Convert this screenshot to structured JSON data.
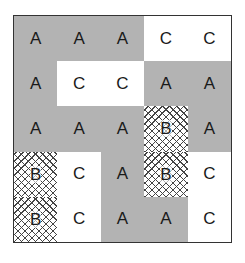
{
  "grid": {
    "rows": [
      [
        "A",
        "A",
        "A",
        "C",
        "C"
      ],
      [
        "A",
        "C",
        "C",
        "A",
        "A"
      ],
      [
        "A",
        "A",
        "A",
        "B",
        "A"
      ],
      [
        "B",
        "C",
        "A",
        "B",
        "C"
      ],
      [
        "B",
        "C",
        "A",
        "A",
        "C"
      ]
    ]
  },
  "legend": {
    "A": {
      "fill": "#b3b3b3",
      "pattern": "solid-gray"
    },
    "B": {
      "fill": "#ffffff",
      "pattern": "crosshatch"
    },
    "C": {
      "fill": "#ffffff",
      "pattern": "solid-white"
    }
  }
}
